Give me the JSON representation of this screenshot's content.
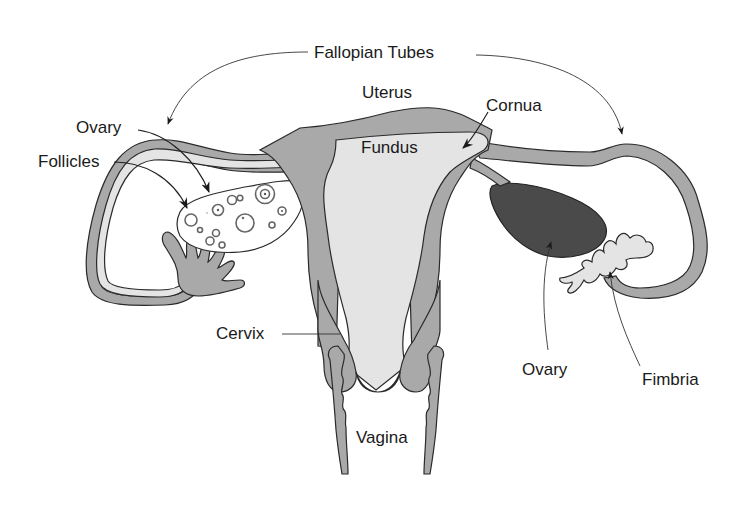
{
  "diagram": {
    "labels": {
      "fallopian_tubes": "Fallopian Tubes",
      "uterus": "Uterus",
      "cornua": "Cornua",
      "fundus": "Fundus",
      "ovary_left": "Ovary",
      "follicles": "Follicles",
      "cervix": "Cervix",
      "vagina": "Vagina",
      "ovary_right": "Ovary",
      "fimbria": "Fimbria"
    },
    "colors": {
      "tissue": "#a9a9a9",
      "cavity": "#e4e4e4",
      "ovary_dark": "#4a4a4a",
      "outline": "#2a2a2a",
      "background": "#ffffff"
    }
  }
}
